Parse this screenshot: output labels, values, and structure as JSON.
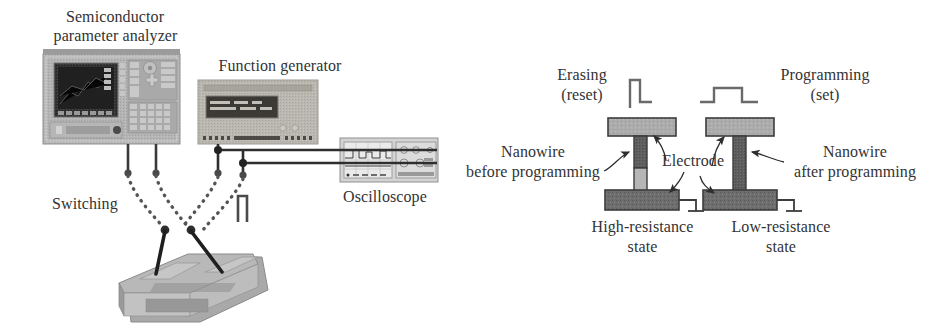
{
  "figure": {
    "title_left": "Semiconductor parameter analyzer",
    "background": "#ffffff"
  },
  "left_panel": {
    "labels": {
      "analyzer_line1": "Semiconductor",
      "analyzer_line2": "parameter analyzer",
      "function_generator": "Function generator",
      "oscilloscope": "Oscilloscope",
      "switching": "Switching",
      "nanowire_sample": "NW"
    },
    "instruments": [
      {
        "name": "semiconductor-parameter-analyzer",
        "label": "Semiconductor parameter analyzer",
        "body_color": "#b3b3b3",
        "screen_color": "#2d2d2d"
      },
      {
        "name": "function-generator",
        "label": "Function generator",
        "body_color": "#b7b5ad",
        "screen_color": "#3a3a34"
      },
      {
        "name": "oscilloscope",
        "label": "Oscilloscope",
        "body_color": "#cfcfcf",
        "screen_color": "#e8e8e8"
      }
    ],
    "pulse_symbol": "square-pulse"
  },
  "right_panel": {
    "left_device": {
      "pulse_label_line1": "Erasing",
      "pulse_label_line2": "(reset)",
      "pulse_type": "narrow-tall-pulse",
      "nanowire_label_line1": "Nanowire",
      "nanowire_label_line2": "before programming",
      "state_label_line1": "High-resistance",
      "state_label_line2": "state",
      "top_electrode_color": "#a8a8a8",
      "bottom_electrode_color": "#6b6b6b",
      "nanowire_upper_color": "#5c5c5c",
      "nanowire_lower_color": "#b0b0b0"
    },
    "right_device": {
      "pulse_label_line1": "Programming",
      "pulse_label_line2": "(set)",
      "pulse_type": "wide-low-pulse",
      "nanowire_label_line1": "Nanowire",
      "nanowire_label_line2": "after programming",
      "state_label_line1": "Low-resistance",
      "state_label_line2": "state",
      "top_electrode_color": "#a8a8a8",
      "bottom_electrode_color": "#6b6b6b",
      "nanowire_color": "#5c5c5c"
    },
    "shared_label": "Electrode",
    "ground_symbol": "ground"
  },
  "colors": {
    "line": "#333333",
    "text": "#333333",
    "dotted_wire": "#555555",
    "electrode_light": "#a8a8a8",
    "electrode_dark": "#6b6b6b"
  }
}
